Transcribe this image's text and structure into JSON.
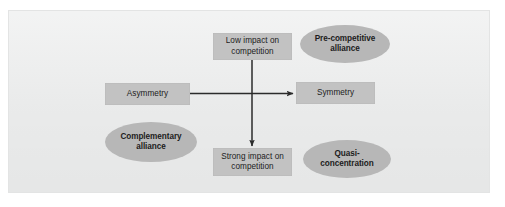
{
  "figure": {
    "panel_background": "#eceded",
    "box_fill": "#c2c2c2",
    "ellipse_fill": "#b7b7b7",
    "arrow_color": "#2b2b2b"
  },
  "nodes": {
    "low_impact": {
      "label": "Low impact on\ncompetition",
      "shape": "rectangle"
    },
    "strong_impact": {
      "label": "Strong impact on\ncompetition",
      "shape": "rectangle"
    },
    "asymmetry": {
      "label": "Asymmetry",
      "shape": "rectangle"
    },
    "symmetry": {
      "label": "Symmetry",
      "shape": "rectangle"
    },
    "pre_competitive": {
      "label": "Pre-competitive\nalliance",
      "shape": "ellipse"
    },
    "complementary": {
      "label": "Complementary\nalliance",
      "shape": "ellipse"
    },
    "quasi_concentration": {
      "label": "Quasi-\nconcentration",
      "shape": "ellipse"
    }
  },
  "arrows": [
    {
      "name": "asymmetry-to-symmetry",
      "direction": "horizontal",
      "from": "Asymmetry",
      "to": "Symmetry"
    },
    {
      "name": "low-impact-to-strong-impact",
      "direction": "vertical",
      "from": "Low impact on competition",
      "to": "Strong impact on competition"
    }
  ]
}
